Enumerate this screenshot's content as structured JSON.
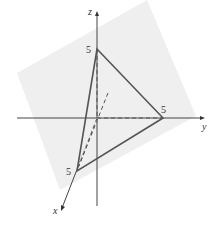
{
  "diagram": {
    "type": "3d-coordinate-plane",
    "axes": {
      "x": {
        "label": "x"
      },
      "y": {
        "label": "y"
      },
      "z": {
        "label": "z"
      }
    },
    "intercepts": {
      "x": "5",
      "y": "5",
      "z": "5"
    },
    "colors": {
      "plane_fill": "#efefef",
      "line": "#555555",
      "axis": "#333333"
    }
  }
}
